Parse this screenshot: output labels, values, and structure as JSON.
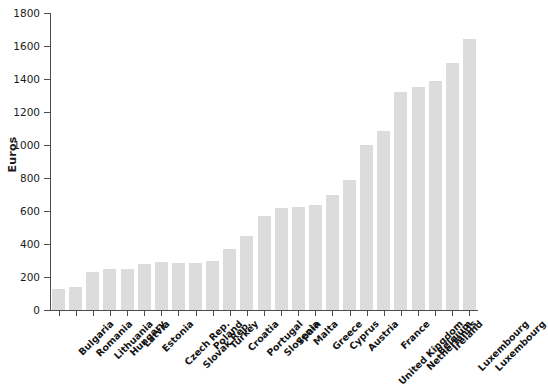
{
  "chart_data": {
    "type": "bar",
    "title": "",
    "xlabel": "",
    "ylabel": "Euros",
    "ylim": [
      0,
      1800
    ],
    "yticks": [
      0,
      200,
      400,
      600,
      800,
      1000,
      1200,
      1400,
      1600,
      1800
    ],
    "grid": false,
    "legend": false,
    "bar_color": "#dcdcdc",
    "axis_color": "#4d4d4d",
    "categories": [
      "Bulgaria",
      "Romania",
      "Lithuania",
      "Hungary",
      "Latvia",
      "Estonia",
      "Czech Rep.",
      "Slovak Rep.",
      "Poland",
      "Turkey",
      "Croatia",
      "Portugal",
      "Slovenia",
      "Spain",
      "Malta",
      "Greece",
      "Cyprus",
      "Austria",
      "United Kingdom",
      "France",
      "Netherlands",
      "Belgium",
      "Ireland",
      "Luxembourg"
    ],
    "values": [
      130,
      140,
      230,
      250,
      250,
      280,
      290,
      285,
      285,
      300,
      370,
      450,
      570,
      620,
      625,
      635,
      695,
      790,
      1000,
      1085,
      1320,
      1350,
      1390,
      1500
    ]
  },
  "extra_bar": {
    "label": "Luxembourg",
    "value": 1640
  }
}
